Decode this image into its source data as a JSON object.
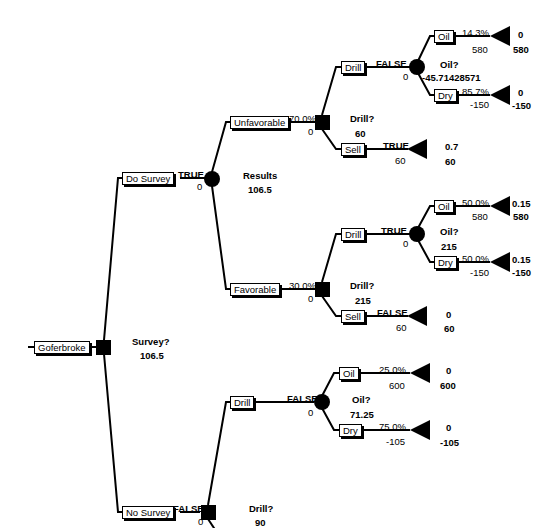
{
  "root": {
    "label": "Goferbroke",
    "decision": "Survey?",
    "value": "106.5"
  },
  "do_survey": {
    "label": "Do Survey",
    "flag": "TRUE",
    "cost": "0",
    "chance_name": "Results",
    "chance_value": "106.5",
    "unfavorable": {
      "label": "Unfavorable",
      "prob": "70.0%",
      "cost": "0",
      "decision": "Drill?",
      "value": "60",
      "drill": {
        "label": "Drill",
        "flag": "FALSE",
        "cost": "0",
        "chance_name": "Oil?",
        "chance_value": "-45.71428571",
        "oil": {
          "label": "Oil",
          "prob": "14.3%",
          "payoff": "580",
          "end_prob": "0",
          "end_value": "580"
        },
        "dry": {
          "label": "Dry",
          "prob": "85.7%",
          "payoff": "-150",
          "end_prob": "0",
          "end_value": "-150"
        }
      },
      "sell": {
        "label": "Sell",
        "flag": "TRUE",
        "payoff": "60",
        "end_prob": "0.7",
        "end_value": "60"
      }
    },
    "favorable": {
      "label": "Favorable",
      "prob": "30.0%",
      "cost": "0",
      "decision": "Drill?",
      "value": "215",
      "drill": {
        "label": "Drill",
        "flag": "TRUE",
        "cost": "0",
        "chance_name": "Oil?",
        "chance_value": "215",
        "oil": {
          "label": "Oil",
          "prob": "50.0%",
          "payoff": "580",
          "end_prob": "0.15",
          "end_value": "580"
        },
        "dry": {
          "label": "Dry",
          "prob": "50.0%",
          "payoff": "-150",
          "end_prob": "0.15",
          "end_value": "-150"
        }
      },
      "sell": {
        "label": "Sell",
        "flag": "FALSE",
        "payoff": "60",
        "end_prob": "0",
        "end_value": "60"
      }
    }
  },
  "no_survey": {
    "label": "No Survey",
    "flag": "FALSE",
    "cost": "0",
    "decision": "Drill?",
    "value": "90",
    "drill": {
      "label": "Drill",
      "flag": "FALSE",
      "cost": "0",
      "chance_name": "Oil?",
      "chance_value": "71.25",
      "oil": {
        "label": "Oil",
        "prob": "25.0%",
        "payoff": "600",
        "end_prob": "0",
        "end_value": "600"
      },
      "dry": {
        "label": "Dry",
        "prob": "75.0%",
        "payoff": "-105",
        "end_prob": "0",
        "end_value": "-105"
      }
    },
    "sell": {
      "label": "Sell",
      "flag": "TRUE",
      "payoff": "90",
      "end_prob": "0",
      "end_value": "90"
    }
  }
}
